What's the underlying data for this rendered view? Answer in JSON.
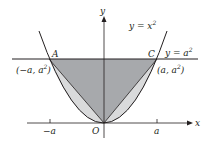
{
  "figure": {
    "type": "diagram",
    "colors": {
      "background": "#ffffff",
      "dark_fill": "#a7a9ac",
      "light_fill": "#d9dadb",
      "stroke": "#231f20"
    },
    "axes": {
      "x_label": "x",
      "y_label": "y",
      "origin_label": "O",
      "ticks": [
        {
          "label": "−a",
          "x_value": "-a"
        },
        {
          "label": "a",
          "x_value": "a"
        }
      ]
    },
    "curves": [
      {
        "name": "parabola",
        "equation_main": "y = x",
        "equation_sup": "2"
      },
      {
        "name": "horizontal-line",
        "equation_main": "y = a",
        "equation_sup": "2"
      }
    ],
    "points": [
      {
        "name": "A",
        "coord_main": "(−a, a",
        "coord_sup": "2",
        "coord_end": ")"
      },
      {
        "name": "C",
        "coord_main": "(a, a",
        "coord_sup": "2",
        "coord_end": ")"
      },
      {
        "name": "O"
      }
    ]
  }
}
